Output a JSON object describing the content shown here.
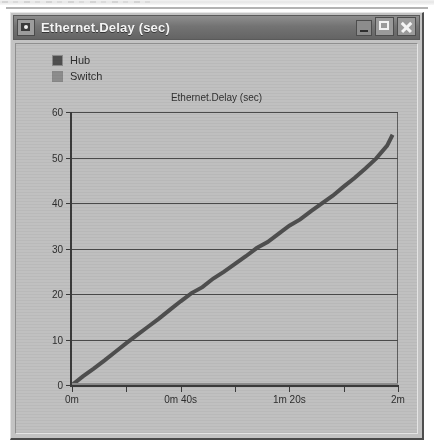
{
  "window": {
    "title": "Ethernet.Delay (sec)",
    "icon": "window-menu-icon",
    "buttons": {
      "minimize": "minimize-icon",
      "maximize": "maximize-icon",
      "close": "close-icon"
    }
  },
  "legend": {
    "position": "top-left",
    "items": [
      {
        "label": "Hub",
        "color": "#4f4f4f"
      },
      {
        "label": "Switch",
        "color": "#8d8d8d"
      }
    ]
  },
  "chart_data": {
    "type": "line",
    "title": "Ethernet.Delay (sec)",
    "xlabel": "",
    "ylabel": "",
    "grid": true,
    "ylim": [
      0,
      60
    ],
    "yticks": [
      0,
      10,
      20,
      30,
      40,
      50,
      60
    ],
    "ytick_labels": [
      "0",
      "10",
      "20",
      "30",
      "40",
      "50",
      "60"
    ],
    "xlim": [
      0,
      120
    ],
    "xticks": [
      0,
      20,
      40,
      60,
      80,
      100,
      120
    ],
    "xtick_labels": [
      "0m",
      "",
      "0m 40s",
      "",
      "1m 20s",
      "",
      "2m"
    ],
    "legend_position": "above-plot-left",
    "series": [
      {
        "name": "Hub",
        "color": "#4f4f4f",
        "x": [
          0,
          4,
          8,
          12,
          16,
          20,
          24,
          28,
          32,
          36,
          40,
          44,
          48,
          52,
          56,
          60,
          64,
          68,
          72,
          76,
          80,
          84,
          88,
          92,
          96,
          100,
          104,
          108,
          112,
          116,
          118
        ],
        "y": [
          0,
          1.9,
          3.6,
          5.4,
          7.3,
          9.2,
          11.0,
          12.8,
          14.6,
          16.5,
          18.4,
          20.2,
          21.5,
          23.4,
          24.9,
          26.6,
          28.3,
          30.1,
          31.4,
          33.2,
          35.0,
          36.4,
          38.2,
          39.9,
          41.6,
          43.6,
          45.5,
          47.6,
          49.8,
          52.6,
          55.0
        ]
      },
      {
        "name": "Switch",
        "color": "#8d8d8d",
        "x": [
          0,
          20,
          40,
          60,
          80,
          100,
          120
        ],
        "y": [
          0,
          0,
          0,
          0,
          0,
          0,
          0
        ]
      }
    ]
  }
}
